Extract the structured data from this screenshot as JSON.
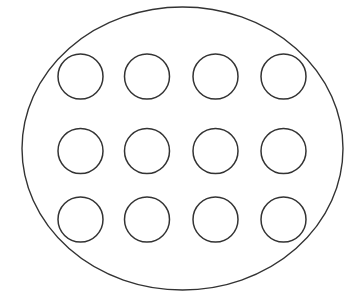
{
  "canvas": {
    "width": 347,
    "height": 307,
    "background": "#ffffff"
  },
  "style": {
    "stroke": "#333333",
    "outer_stroke_width": 1.4,
    "inner_stroke_width": 1.5,
    "fill": "none"
  },
  "outer_ellipse": {
    "cx": 182.5,
    "cy": 148.5,
    "rx": 160.5,
    "ry": 141.5
  },
  "grid": {
    "rows": 3,
    "cols": 4,
    "radius": 22.5,
    "col_centers": [
      80.5,
      147,
      215.5,
      283.5
    ],
    "row_centers": [
      76.5,
      151,
      219.5
    ]
  },
  "circle_count": 12
}
